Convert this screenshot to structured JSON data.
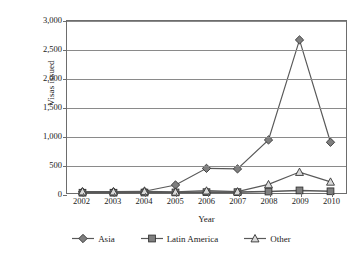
{
  "chart_data": {
    "type": "line",
    "title": "",
    "xlabel": "Year",
    "ylabel": "Visas issued",
    "categories": [
      "2002",
      "2003",
      "2004",
      "2005",
      "2006",
      "2007",
      "2008",
      "2009",
      "2010"
    ],
    "ylim": [
      0,
      3000
    ],
    "ytick_labels": [
      "0",
      "500",
      "1,000",
      "1,500",
      "2,000",
      "2,500",
      "3,000"
    ],
    "ytick_values": [
      0,
      500,
      1000,
      1500,
      2000,
      2500,
      3000
    ],
    "grid": true,
    "legend_position": "bottom",
    "series": [
      {
        "name": "Asia",
        "marker": "diamond",
        "color": "#595959",
        "values": [
          20,
          20,
          30,
          140,
          430,
          420,
          925,
          2670,
          885
        ]
      },
      {
        "name": "Latin America",
        "marker": "square",
        "color": "#595959",
        "values": [
          5,
          5,
          8,
          10,
          15,
          15,
          25,
          45,
          30
        ]
      },
      {
        "name": "Other",
        "marker": "triangle",
        "color": "#595959",
        "values": [
          25,
          25,
          30,
          20,
          40,
          25,
          150,
          365,
          195
        ]
      }
    ]
  }
}
